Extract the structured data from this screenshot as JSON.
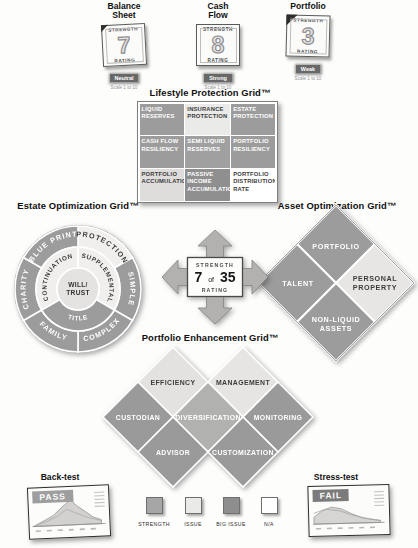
{
  "scorecards": [
    {
      "title_line1": "Balance",
      "title_line2": "Sheet",
      "strength_label": "STRENGTH",
      "value": "7",
      "rating_label": "RATING",
      "verdict": "Neutral",
      "scale_note": "Scale 1 to 10"
    },
    {
      "title_line1": "Cash",
      "title_line2": "Flow",
      "strength_label": "STRENGTH",
      "value": "8",
      "rating_label": "RATING",
      "verdict": "Strong",
      "scale_note": "Scale 1 to 10"
    },
    {
      "title_line1": "Portfolio",
      "title_line2": "",
      "strength_label": "STRENGTH",
      "value": "3",
      "rating_label": "RATING",
      "verdict": "Weak",
      "scale_note": "Scale 1 to 10"
    }
  ],
  "lifestyle_grid": {
    "title": "Lifestyle Protection Grid™",
    "cells": [
      {
        "label": "LIQUID RESERVES",
        "bg": "#9c9c9c",
        "fg": "#ffffff"
      },
      {
        "label": "INSURANCE PROTECTION",
        "bg": "#eaeae8",
        "fg": "#3c3c3c"
      },
      {
        "label": "ESTATE PROTECTION",
        "bg": "#9c9c9c",
        "fg": "#ffffff"
      },
      {
        "label": "CASH FLOW RESILIENCY",
        "bg": "#9c9c9c",
        "fg": "#ffffff"
      },
      {
        "label": "SEMI LIQUID RESERVES",
        "bg": "#a0a0a0",
        "fg": "#ffffff"
      },
      {
        "label": "PORTFOLIO RESILIENCY",
        "bg": "#9c9c9c",
        "fg": "#ffffff"
      },
      {
        "label": "PORTFOLIO ACCUMULATION",
        "bg": "#dedddb",
        "fg": "#3c3c3c"
      },
      {
        "label": "PASSIVE INCOME ACCUMULATION",
        "bg": "#8f8f8f",
        "fg": "#ffffff"
      },
      {
        "label": "PORTFOLIO DISTRIBUTION RATE",
        "bg": "#ffffff",
        "fg": "#3c3c3c"
      }
    ]
  },
  "estate_grid": {
    "title": "Estate Optimization Grid™",
    "outer_ring": [
      {
        "label": "PROTECTION",
        "bg": "#f0efed",
        "fg": "#3c3c3c"
      },
      {
        "label": "SIMPLE",
        "bg": "#9c9c9c",
        "fg": "#ffffff"
      },
      {
        "label": "COMPLEX",
        "bg": "#9c9c9c",
        "fg": "#ffffff"
      },
      {
        "label": "FAMILY",
        "bg": "#9c9c9c",
        "fg": "#ffffff"
      },
      {
        "label": "CHARITY",
        "bg": "#9c9c9c",
        "fg": "#ffffff"
      },
      {
        "label": "BLUE PRINT",
        "bg": "#9c9c9c",
        "fg": "#ffffff"
      }
    ],
    "middle_ring": [
      {
        "label": "SUPPLEMENTAL",
        "bg": "#f0efed",
        "fg": "#3c3c3c"
      },
      {
        "label": "TITLE",
        "bg": "#9c9c9c",
        "fg": "#ffffff"
      },
      {
        "label": "CONTINUATION",
        "bg": "#f0efed",
        "fg": "#3c3c3c"
      }
    ],
    "center": {
      "line1": "WILL/",
      "line2": "TRUST",
      "bg": "#e4e3e1",
      "fg": "#333333"
    }
  },
  "asset_grid": {
    "title": "Asset Optimization Grid™",
    "cells": [
      {
        "label": "PORTFOLIO",
        "bg": "#9c9c9c",
        "fg": "#ffffff"
      },
      {
        "label": "TALENT",
        "bg": "#9c9c9c",
        "fg": "#ffffff"
      },
      {
        "line1": "PERSONAL",
        "line2": "PROPERTY",
        "bg": "#e7e6e4",
        "fg": "#3c3c3c"
      },
      {
        "line1": "NON-LIQUID",
        "line2": "ASSETS",
        "bg": "#9c9c9c",
        "fg": "#ffffff"
      }
    ]
  },
  "rating_box": {
    "strength_label": "STRENGTH",
    "value": "7",
    "connector": "of",
    "total": "35",
    "rating_label": "RATING"
  },
  "enhancement_grid": {
    "title": "Portfolio Enhancement Grid™",
    "cells": [
      {
        "label": "EFFICIENCY",
        "bg": "#e3e2e0",
        "fg": "#3c3c3c"
      },
      {
        "label": "MANAGEMENT",
        "bg": "#e6e5e3",
        "fg": "#3c3c3c"
      },
      {
        "label": "CUSTODIAN",
        "bg": "#9a9a9a",
        "fg": "#ffffff"
      },
      {
        "label": "DIVERSIFICATION",
        "bg": "#b1b1af",
        "fg": "#ffffff"
      },
      {
        "label": "MONITORING",
        "bg": "#9a9a9a",
        "fg": "#ffffff"
      },
      {
        "label": "ADVISOR",
        "bg": "#9a9a9a",
        "fg": "#ffffff"
      },
      {
        "label": "CUSTOMIZATION",
        "bg": "#9a9a9a",
        "fg": "#ffffff"
      }
    ]
  },
  "backtest": {
    "title": "Back-test",
    "badge": "PASS",
    "badge_bg": "#9e9e9e"
  },
  "stresstest": {
    "title": "Stress-test",
    "badge": "FAIL",
    "badge_bg": "#7b7b7b"
  },
  "legend": {
    "items": [
      {
        "label": "STRENGTH",
        "color": "#a6a6a6"
      },
      {
        "label": "ISSUE",
        "color": "#eaeae8"
      },
      {
        "label": "BIG ISSUE",
        "color": "#8e8e8e"
      },
      {
        "label": "N/A",
        "color": "#ffffff"
      }
    ]
  }
}
